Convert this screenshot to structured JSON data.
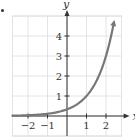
{
  "chart_data": {
    "type": "line",
    "title": "",
    "xlabel": "x",
    "ylabel": "y",
    "xlim": [
      -2.8,
      2.8
    ],
    "ylim": [
      -1,
      5
    ],
    "grid": true,
    "x_ticks": [
      -2,
      -1,
      1,
      2
    ],
    "x_tick_labels": [
      "−2",
      "−1",
      "1",
      "2"
    ],
    "y_ticks": [
      1,
      2,
      3,
      4
    ],
    "y_tick_labels": [
      "1",
      "2",
      "3",
      "4"
    ],
    "series": [
      {
        "name": "y = 3^(x-1)",
        "color": "#777777",
        "x": [
          -2.8,
          -2,
          -1.5,
          -1,
          -0.5,
          0,
          0.5,
          1,
          1.5,
          2,
          2.2,
          2.4
        ],
        "values": [
          0.015,
          0.037,
          0.064,
          0.111,
          0.192,
          0.333,
          0.577,
          1.0,
          1.732,
          3.0,
          3.74,
          4.66
        ]
      }
    ],
    "legend": null
  },
  "colors": {
    "curve": "#777777",
    "axis": "#333333",
    "grid": "#dddddd",
    "text": "#333333"
  }
}
